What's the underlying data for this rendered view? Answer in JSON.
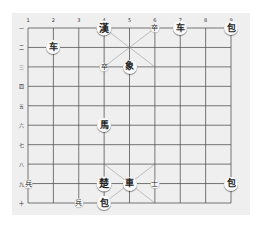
{
  "board": {
    "columns": 9,
    "rows": 10,
    "column_labels": [
      "1",
      "2",
      "3",
      "4",
      "5",
      "6",
      "7",
      "8",
      "9"
    ],
    "row_labels": [
      "一",
      "二",
      "三",
      "四",
      "五",
      "六",
      "七",
      "八",
      "九",
      "十"
    ],
    "line_color": "#555555",
    "background": "#efefef"
  },
  "pieces": [
    {
      "char": "漢",
      "col": 4,
      "row": 1,
      "size": "big"
    },
    {
      "char": "卒",
      "col": 6,
      "row": 1,
      "size": "small"
    },
    {
      "char": "车",
      "col": 7,
      "row": 1,
      "size": "mid"
    },
    {
      "char": "包",
      "col": 9,
      "row": 1,
      "size": "mid"
    },
    {
      "char": "车",
      "col": 2,
      "row": 2,
      "size": "mid"
    },
    {
      "char": "卒",
      "col": 4,
      "row": 3,
      "size": "small"
    },
    {
      "char": "象",
      "col": 5,
      "row": 3,
      "size": "mid"
    },
    {
      "char": "馬",
      "col": 4,
      "row": 6,
      "size": "mid"
    },
    {
      "char": "兵",
      "col": 1,
      "row": 9,
      "size": "small"
    },
    {
      "char": "楚",
      "col": 4,
      "row": 9,
      "size": "big"
    },
    {
      "char": "車",
      "col": 5,
      "row": 9,
      "size": "mid"
    },
    {
      "char": "士",
      "col": 6,
      "row": 9,
      "size": "small"
    },
    {
      "char": "包",
      "col": 9,
      "row": 9,
      "size": "mid"
    },
    {
      "char": "兵",
      "col": 3,
      "row": 10,
      "size": "small"
    },
    {
      "char": "包",
      "col": 4,
      "row": 10,
      "size": "mid"
    }
  ]
}
